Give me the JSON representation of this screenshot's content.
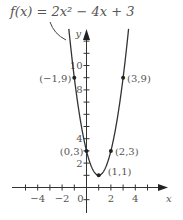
{
  "chart_data": {
    "type": "line",
    "title": "f(x) = 2x² − 4x + 3",
    "function": "2x^2 - 4x + 3",
    "xlabel": "x",
    "ylabel": "y",
    "x_ticks": [
      -5,
      -4,
      -3,
      -2,
      -1,
      0,
      1,
      2,
      3,
      4,
      5
    ],
    "x_tick_labels": [
      "−4",
      "−2",
      "0",
      "2",
      "4"
    ],
    "x_tick_label_values": [
      -4,
      -2,
      0,
      2,
      4
    ],
    "y_ticks": [
      -1,
      1,
      2,
      3,
      4,
      5,
      6,
      7,
      8,
      9,
      10,
      11,
      12
    ],
    "y_tick_labels": [
      "2",
      "4",
      "8",
      "10"
    ],
    "y_tick_label_values": [
      2,
      4,
      8,
      10
    ],
    "xlim": [
      -5.5,
      6.5
    ],
    "ylim": [
      -1.5,
      13
    ],
    "labeled_points": [
      {
        "x": -1,
        "y": 9,
        "label": "(−1,9)"
      },
      {
        "x": 3,
        "y": 9,
        "label": "(3,9)"
      },
      {
        "x": 0,
        "y": 3,
        "label": "(0,3)"
      },
      {
        "x": 2,
        "y": 3,
        "label": "(2,3)"
      },
      {
        "x": 1,
        "y": 1,
        "label": "(1,1)"
      }
    ],
    "vertex": {
      "x": 1,
      "y": 1
    },
    "grid": false,
    "curve_color": "#333333"
  }
}
